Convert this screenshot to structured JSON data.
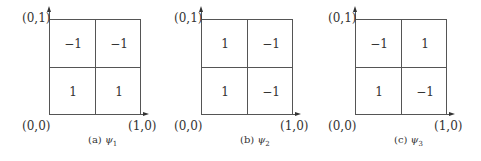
{
  "panels": [
    {
      "caption_prefix": "(a)",
      "caption_func": "ψ",
      "caption_sub": "1",
      "coords": {
        "top_left": "(0,1)",
        "origin": "(0,0)",
        "bottom_right": "(1,0)"
      },
      "cells": {
        "top_left": "−1",
        "top_right": "−1",
        "bottom_left": "1",
        "bottom_right": "1"
      }
    },
    {
      "caption_prefix": "(b)",
      "caption_func": "ψ",
      "caption_sub": "2",
      "coords": {
        "top_left": "(0,1)",
        "origin": "(0,0)",
        "bottom_right": "(1,0)"
      },
      "cells": {
        "top_left": "1",
        "top_right": "−1",
        "bottom_left": "1",
        "bottom_right": "−1"
      }
    },
    {
      "caption_prefix": "(c)",
      "caption_func": "ψ",
      "caption_sub": "3",
      "coords": {
        "top_left": "(0,1)",
        "origin": "(0,0)",
        "bottom_right": "(1,0)"
      },
      "cells": {
        "top_left": "−1",
        "top_right": "1",
        "bottom_left": "1",
        "bottom_right": "−1"
      }
    }
  ]
}
